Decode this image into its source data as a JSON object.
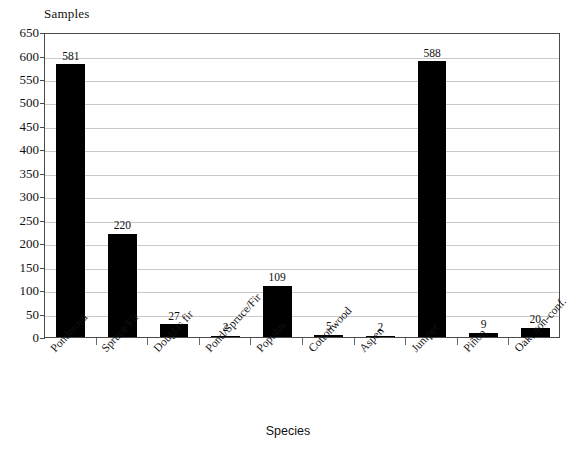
{
  "chart_data": {
    "type": "bar",
    "title": "",
    "ylabel": "Samples",
    "xlabel": "Species",
    "ylim": [
      0,
      650
    ],
    "ytick_step": 50,
    "yticks": [
      0,
      50,
      100,
      150,
      200,
      250,
      300,
      350,
      400,
      450,
      500,
      550,
      600,
      650
    ],
    "grid": true,
    "legend": "none",
    "bar_color": "#000000",
    "categories": [
      "Ponderosa",
      "Spruce/Fir",
      "Douglas fir",
      "Pond/Spruce/Fir",
      "Populus",
      "Cottonwood",
      "Aspen",
      "Juniper",
      "Piñon",
      "Oak; non-conf."
    ],
    "values": [
      581,
      220,
      27,
      2,
      109,
      5,
      2,
      588,
      9,
      20
    ],
    "data_labels": [
      "581",
      "220",
      "27",
      "2",
      "109",
      "5",
      "2",
      "588",
      "9",
      "20"
    ]
  }
}
